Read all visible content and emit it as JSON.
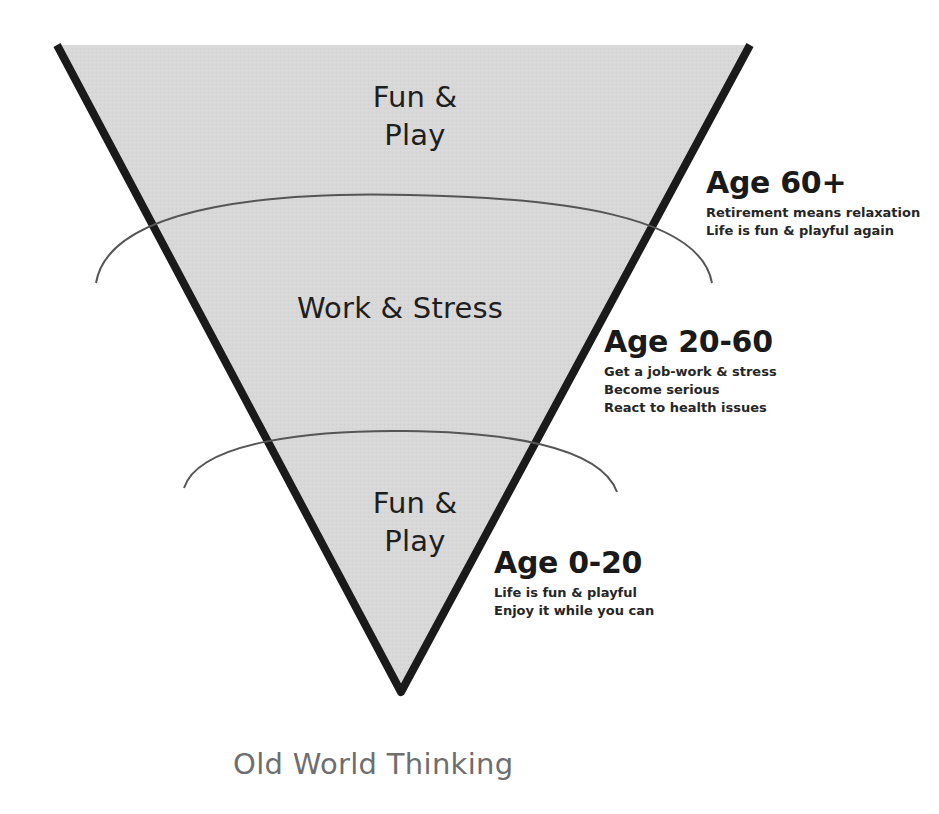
{
  "diagram": {
    "title": "Old World Thinking",
    "colors": {
      "fill": "#d6d6d6",
      "outline": "#1a1a1a",
      "arc": "#555555",
      "title": "#6e6e6e",
      "text": "#1e1e1e"
    },
    "bands": [
      {
        "id": "top",
        "label_line1": "Fun &",
        "label_line2": "Play"
      },
      {
        "id": "middle",
        "label_line1": "Work & Stress",
        "label_line2": ""
      },
      {
        "id": "bottom",
        "label_line1": "Fun &",
        "label_line2": "Play"
      }
    ],
    "stages": [
      {
        "age": "Age 60+",
        "lines": [
          "Retirement means relaxation",
          "Life is fun & playful again"
        ]
      },
      {
        "age": "Age 20-60",
        "lines": [
          "Get a job-work & stress",
          "Become serious",
          "React to health issues"
        ]
      },
      {
        "age": "Age 0-20",
        "lines": [
          "Life is fun & playful",
          "Enjoy it while you can"
        ]
      }
    ]
  }
}
